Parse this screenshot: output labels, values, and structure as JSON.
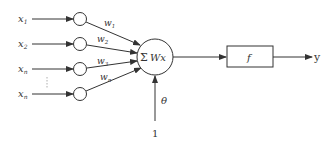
{
  "diagram": {
    "title": "",
    "inputs": [
      {
        "label": "x",
        "sub": "1",
        "weight": "w",
        "wsub": "1"
      },
      {
        "label": "x",
        "sub": "2",
        "weight": "w",
        "wsub": "2"
      },
      {
        "label": "x",
        "sub": "n",
        "weight": "w",
        "wsub": "3"
      },
      {
        "label": "x",
        "sub": "n",
        "weight": "w",
        "wsub": "n"
      }
    ],
    "ellipsis": "⋮",
    "sum_node": {
      "symbol": "Σ",
      "text": "Wx"
    },
    "activation": {
      "label": "f"
    },
    "output": {
      "label": "y"
    },
    "bias": {
      "weight": "θ",
      "input": "1"
    },
    "colors": {
      "stroke": "#333333",
      "background": "#ffffff"
    }
  }
}
